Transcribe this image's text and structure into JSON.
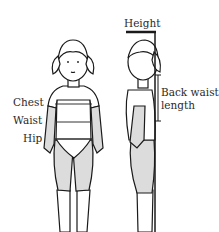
{
  "figure": {
    "front_view": {
      "labels": {
        "chest": "Chest",
        "waist": "Waist",
        "hip": "Hip"
      }
    },
    "side_view": {
      "labels": {
        "height": "Height",
        "back_waist_line1": "Back waist",
        "back_waist_line2": "length"
      }
    },
    "colors": {
      "line": "#1a1a1a",
      "fill_skin": "#ffffff",
      "fill_clothing": "#dcdcdc",
      "text": "#2a2a2a"
    }
  }
}
